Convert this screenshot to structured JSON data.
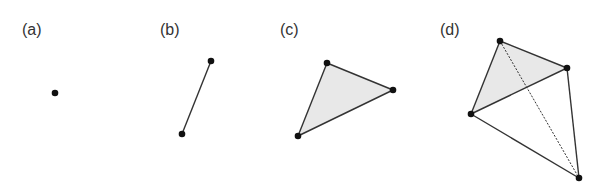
{
  "panels": [
    {
      "label": "(a)",
      "label_x": 22,
      "vertices": [
        [
          55,
          93
        ]
      ],
      "edges": [],
      "dashed_edges": [],
      "faces": []
    },
    {
      "label": "(b)",
      "label_x": 160,
      "vertices": [
        [
          211,
          61
        ],
        [
          182,
          134
        ]
      ],
      "edges": [
        [
          0,
          1
        ]
      ],
      "dashed_edges": [],
      "faces": []
    },
    {
      "label": "(c)",
      "label_x": 280,
      "vertices": [
        [
          327,
          63
        ],
        [
          393,
          90
        ],
        [
          298,
          136
        ]
      ],
      "edges": [
        [
          0,
          1
        ],
        [
          1,
          2
        ],
        [
          2,
          0
        ]
      ],
      "dashed_edges": [],
      "faces": [
        [
          0,
          1,
          2
        ]
      ]
    },
    {
      "label": "(d)",
      "label_x": 440,
      "vertices": [
        [
          500,
          41
        ],
        [
          567,
          68
        ],
        [
          471,
          114
        ],
        [
          579,
          178
        ]
      ],
      "edges": [
        [
          0,
          1
        ],
        [
          1,
          2
        ],
        [
          2,
          0
        ],
        [
          2,
          3
        ],
        [
          1,
          3
        ]
      ],
      "dashed_edges": [
        [
          0,
          3
        ]
      ],
      "faces": [
        [
          0,
          1,
          2
        ]
      ]
    }
  ],
  "colors": {
    "vertex": "#111111",
    "edge": "#333333",
    "face_fill": "#e8e8e8",
    "label": "#333333"
  }
}
